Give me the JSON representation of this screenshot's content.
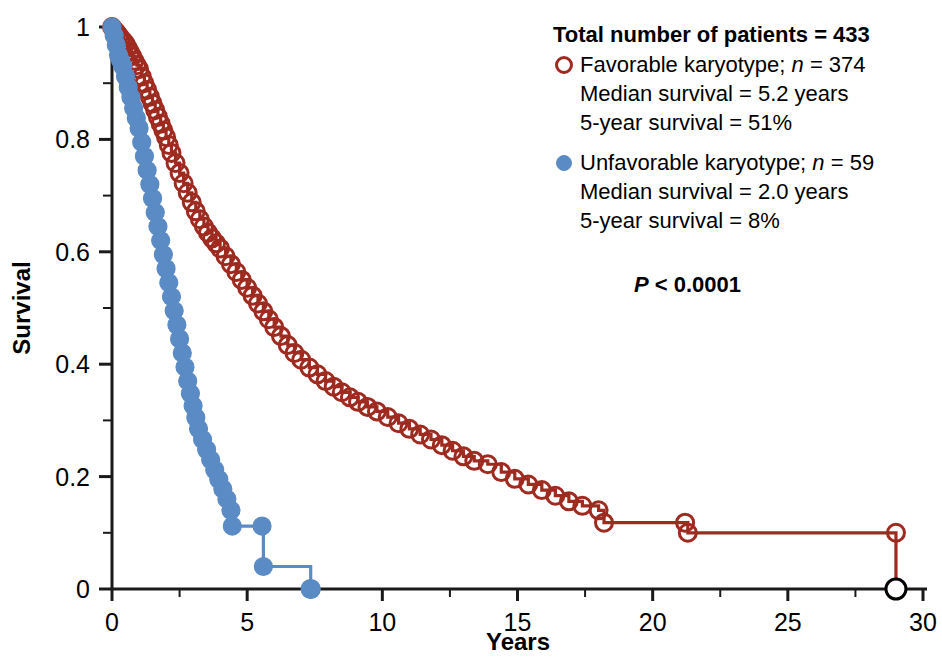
{
  "chart_data": {
    "type": "line",
    "subtype": "kaplan-meier-survival",
    "title": "",
    "xlabel": "Years",
    "ylabel": "Survival",
    "xlim": [
      0,
      30
    ],
    "ylim": [
      0,
      1
    ],
    "xticks": [
      0,
      5,
      10,
      15,
      20,
      25,
      30
    ],
    "xticklabels": [
      "0",
      "5",
      "10",
      "15",
      "20",
      "25",
      "30"
    ],
    "xminorticks": [
      2.5,
      7.5,
      12.5,
      17.5,
      22.5,
      27.5
    ],
    "yticks": [
      0,
      0.2,
      0.4,
      0.6,
      0.8,
      1
    ],
    "yticklabels": [
      "0",
      "0.2",
      "0.4",
      "0.6",
      "0.8",
      "1"
    ],
    "yminorticks": [
      0.1,
      0.3,
      0.5,
      0.7,
      0.9
    ],
    "grid": false,
    "legend_position": "upper-right",
    "series": [
      {
        "name": "Favorable karyotype",
        "color": "#9e2a20",
        "marker": "open-circle",
        "n": 374,
        "median_survival_years": 5.2,
        "five_year_survival_pct": 51,
        "x": [
          0,
          0.08,
          0.17,
          0.25,
          0.33,
          0.42,
          0.5,
          0.58,
          0.67,
          0.75,
          0.83,
          0.92,
          1.0,
          1.1,
          1.2,
          1.3,
          1.4,
          1.5,
          1.6,
          1.7,
          1.8,
          1.9,
          2.0,
          2.1,
          2.2,
          2.35,
          2.5,
          2.65,
          2.8,
          2.95,
          3.1,
          3.25,
          3.4,
          3.55,
          3.7,
          3.85,
          4.0,
          4.2,
          4.4,
          4.6,
          4.8,
          5.0,
          5.2,
          5.4,
          5.6,
          5.8,
          6.0,
          6.25,
          6.5,
          6.75,
          7.0,
          7.3,
          7.6,
          7.9,
          8.2,
          8.5,
          8.8,
          9.1,
          9.45,
          9.8,
          10.2,
          10.6,
          11.0,
          11.4,
          11.8,
          12.2,
          12.6,
          13.0,
          13.4,
          13.9,
          14.4,
          14.9,
          15.4,
          15.9,
          16.4,
          16.9,
          17.4,
          18.0,
          18.2,
          21.2,
          21.3,
          29.0
        ],
        "y": [
          1.0,
          0.995,
          0.99,
          0.985,
          0.98,
          0.975,
          0.97,
          0.963,
          0.955,
          0.948,
          0.94,
          0.932,
          0.925,
          0.912,
          0.9,
          0.888,
          0.876,
          0.864,
          0.852,
          0.84,
          0.828,
          0.816,
          0.804,
          0.79,
          0.776,
          0.758,
          0.74,
          0.722,
          0.705,
          0.688,
          0.672,
          0.658,
          0.645,
          0.634,
          0.624,
          0.615,
          0.606,
          0.592,
          0.578,
          0.564,
          0.55,
          0.536,
          0.522,
          0.508,
          0.494,
          0.48,
          0.466,
          0.45,
          0.434,
          0.42,
          0.408,
          0.394,
          0.382,
          0.37,
          0.36,
          0.35,
          0.341,
          0.333,
          0.324,
          0.316,
          0.306,
          0.295,
          0.285,
          0.275,
          0.266,
          0.256,
          0.246,
          0.236,
          0.228,
          0.222,
          0.208,
          0.196,
          0.186,
          0.176,
          0.166,
          0.156,
          0.148,
          0.14,
          0.118,
          0.118,
          0.1,
          0.1
        ],
        "terminal_point": {
          "x": 29.0,
          "y": 0,
          "marker": "open-circle-black"
        }
      },
      {
        "name": "Unfavorable karyotype",
        "color": "#5b8bc4",
        "marker": "filled-circle",
        "n": 59,
        "median_survival_years": 2.0,
        "five_year_survival_pct": 8,
        "x": [
          0,
          0.08,
          0.16,
          0.24,
          0.32,
          0.4,
          0.5,
          0.6,
          0.7,
          0.8,
          0.9,
          1.0,
          1.1,
          1.2,
          1.3,
          1.4,
          1.5,
          1.6,
          1.7,
          1.8,
          1.9,
          2.0,
          2.1,
          2.2,
          2.3,
          2.4,
          2.5,
          2.6,
          2.7,
          2.8,
          2.9,
          3.0,
          3.1,
          3.2,
          3.35,
          3.5,
          3.65,
          3.8,
          3.95,
          4.1,
          4.25,
          4.4,
          4.45,
          5.55,
          5.6,
          7.35
        ],
        "y": [
          1.0,
          0.985,
          0.968,
          0.95,
          0.94,
          0.93,
          0.912,
          0.893,
          0.875,
          0.856,
          0.838,
          0.82,
          0.795,
          0.77,
          0.745,
          0.72,
          0.695,
          0.67,
          0.645,
          0.62,
          0.595,
          0.57,
          0.545,
          0.52,
          0.495,
          0.47,
          0.445,
          0.42,
          0.395,
          0.37,
          0.348,
          0.326,
          0.305,
          0.285,
          0.266,
          0.248,
          0.23,
          0.212,
          0.195,
          0.178,
          0.16,
          0.14,
          0.112,
          0.112,
          0.04,
          0.0
        ],
        "terminal_point": {
          "x": 7.35,
          "y": 0,
          "marker": "filled-circle"
        }
      }
    ]
  },
  "legend": {
    "total_label": "Total number of patients = 433",
    "entries": [
      {
        "marker": "open-circle-red-icon",
        "line1_prefix": "Favorable karyotype; ",
        "line1_n_italic": "n",
        "line1_suffix": " = 374",
        "line2": "Median survival = 5.2 years",
        "line3": "5-year survival = 51%"
      },
      {
        "marker": "filled-circle-blue-icon",
        "line1_prefix": "Unfavorable karyotype; ",
        "line1_n_italic": "n",
        "line1_suffix": " = 59",
        "line2": "Median survival = 2.0 years",
        "line3": "5-year survival = 8%"
      }
    ],
    "pvalue_italic": "P",
    "pvalue_rest": " < 0.0001"
  },
  "axes": {
    "x_title": "Years",
    "y_title": "Survival"
  },
  "colors": {
    "favorable": "#9e2a20",
    "unfavorable": "#5b8bc4",
    "axis": "#1a1a1a",
    "terminal": "#000000",
    "background": "#ffffff"
  }
}
